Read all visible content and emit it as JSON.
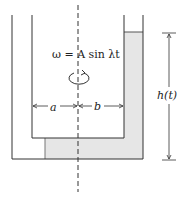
{
  "diagram": {
    "equation": "ω = A sin λt",
    "label_a": "a",
    "label_b": "b",
    "label_h": "h(t)",
    "rotation_icon": "rotation-arrow-icon",
    "colors": {
      "line": "#333333",
      "fluid": "#e6e6e6",
      "background": "#ffffff"
    }
  }
}
